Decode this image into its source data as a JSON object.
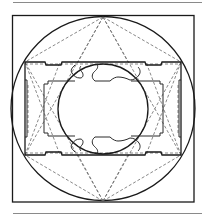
{
  "figure": {
    "type": "geometric-construction-diagram",
    "colors": {
      "ink": "#1a1a1a",
      "construction": "#6a6a6a",
      "rule": "#8a8a8a",
      "background": "#ffffff"
    },
    "elements": {
      "outer_square": {
        "x": 12,
        "y": 15,
        "w": 182,
        "h": 187
      },
      "outer_circle": {
        "cx": 103,
        "cy": 108,
        "r": 92
      },
      "rectangle": {
        "x1": 25,
        "y1": 62,
        "x2": 181,
        "y2": 155
      },
      "inner_frame": {
        "x1": 44,
        "y1": 81,
        "x2": 164,
        "y2": 137
      },
      "inner_circle": {
        "cx": 103,
        "cy": 109,
        "r": 45
      },
      "top_apex": {
        "x": 103,
        "y": 17
      },
      "bottom_apex": {
        "x": 103,
        "y": 201
      }
    },
    "labels": []
  }
}
